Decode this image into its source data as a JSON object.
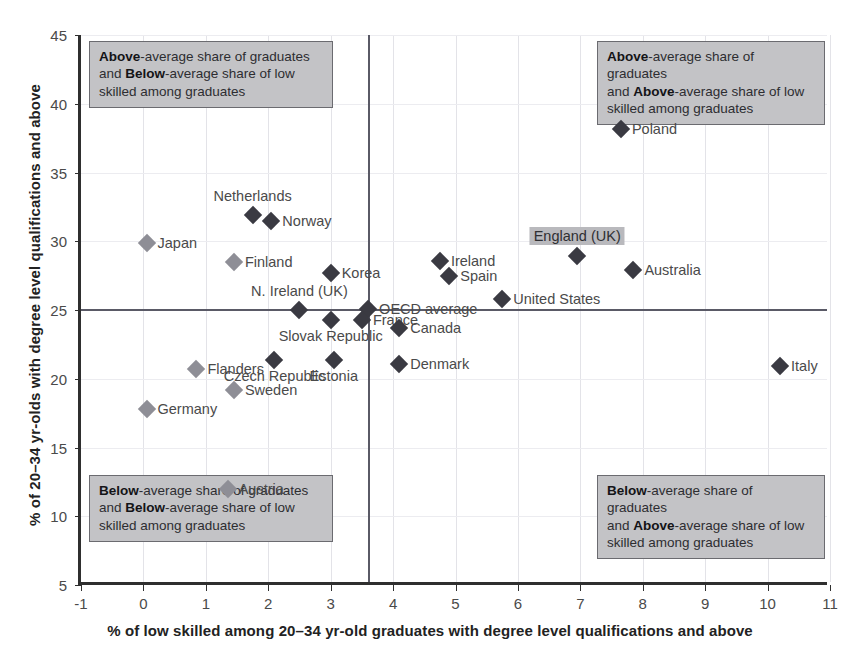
{
  "chart_data": {
    "type": "scatter",
    "title": "",
    "xlabel": "% of low skilled among 20–34 yr-old graduates with degree level qualifications and above",
    "ylabel": "% of 20–34 yr-olds with degree level qualifications and above",
    "xlim": [
      -1,
      11
    ],
    "ylim": [
      5,
      45
    ],
    "xticks": [
      "-1",
      "0",
      "1",
      "2",
      "3",
      "4",
      "5",
      "6",
      "7",
      "8",
      "9",
      "10",
      "11"
    ],
    "xtick_values": [
      -1,
      0,
      1,
      2,
      3,
      4,
      5,
      6,
      7,
      8,
      9,
      10,
      11
    ],
    "yticks": [
      "5",
      "10",
      "15",
      "20",
      "25",
      "30",
      "35",
      "40",
      "45"
    ],
    "ytick_values": [
      5,
      10,
      15,
      20,
      25,
      30,
      35,
      40,
      45
    ],
    "grid": true,
    "legend": "none",
    "reference_lines": {
      "vertical_x": 3.6,
      "horizontal_y": 25.1,
      "description": "OECD average lines"
    },
    "points": [
      {
        "label": "Japan",
        "x": 0.05,
        "y": 29.9,
        "marker": "light",
        "label_pos": "right"
      },
      {
        "label": "Netherlands",
        "x": 1.75,
        "y": 31.9,
        "marker": "dark",
        "label_pos": "above"
      },
      {
        "label": "Norway",
        "x": 2.05,
        "y": 31.5,
        "marker": "dark",
        "label_pos": "right"
      },
      {
        "label": "Finland",
        "x": 1.45,
        "y": 28.5,
        "marker": "light",
        "label_pos": "right"
      },
      {
        "label": "Korea",
        "x": 3.0,
        "y": 27.7,
        "marker": "dark",
        "label_pos": "right"
      },
      {
        "label": "Ireland",
        "x": 4.75,
        "y": 28.6,
        "marker": "dark",
        "label_pos": "right"
      },
      {
        "label": "Spain",
        "x": 4.9,
        "y": 27.5,
        "marker": "dark",
        "label_pos": "right"
      },
      {
        "label": "Poland",
        "x": 7.65,
        "y": 38.2,
        "marker": "dark",
        "label_pos": "right"
      },
      {
        "label": "England (UK)",
        "x": 6.95,
        "y": 28.9,
        "marker": "dark",
        "label_pos": "above",
        "highlight": true
      },
      {
        "label": "Australia",
        "x": 7.85,
        "y": 27.9,
        "marker": "dark",
        "label_pos": "right"
      },
      {
        "label": "United States",
        "x": 5.75,
        "y": 25.8,
        "marker": "dark",
        "label_pos": "right"
      },
      {
        "label": "N. Ireland (UK)",
        "x": 2.5,
        "y": 25.0,
        "marker": "dark",
        "label_pos": "above"
      },
      {
        "label": "OECD average",
        "x": 3.6,
        "y": 25.1,
        "marker": "dark",
        "label_pos": "right"
      },
      {
        "label": "France",
        "x": 3.5,
        "y": 24.3,
        "marker": "dark",
        "label_pos": "right"
      },
      {
        "label": "Slovak Republic",
        "x": 3.0,
        "y": 24.3,
        "marker": "dark",
        "label_pos": "below"
      },
      {
        "label": "Canada",
        "x": 4.1,
        "y": 23.7,
        "marker": "dark",
        "label_pos": "right"
      },
      {
        "label": "Czech Republic",
        "x": 2.1,
        "y": 21.4,
        "marker": "dark",
        "label_pos": "below"
      },
      {
        "label": "Estonia",
        "x": 3.05,
        "y": 21.4,
        "marker": "dark",
        "label_pos": "below"
      },
      {
        "label": "Denmark",
        "x": 4.1,
        "y": 21.1,
        "marker": "dark",
        "label_pos": "right"
      },
      {
        "label": "Italy",
        "x": 10.2,
        "y": 20.9,
        "marker": "dark",
        "label_pos": "right"
      },
      {
        "label": "Flanders",
        "x": 0.85,
        "y": 20.7,
        "marker": "light",
        "label_pos": "right"
      },
      {
        "label": "Sweden",
        "x": 1.45,
        "y": 19.2,
        "marker": "light",
        "label_pos": "right"
      },
      {
        "label": "Germany",
        "x": 0.05,
        "y": 17.8,
        "marker": "light",
        "label_pos": "right"
      },
      {
        "label": "Austria",
        "x": 1.35,
        "y": 12.0,
        "marker": "light",
        "label_pos": "right"
      }
    ],
    "annotations": [
      {
        "id": "top-left",
        "line1_bold": "Above",
        "line1_rest": "-average share of graduates",
        "line2_pre": "and ",
        "line2_bold": "Below",
        "line2_rest": "-average share of low",
        "line3": "skilled among graduates"
      },
      {
        "id": "top-right",
        "line1_bold": "Above",
        "line1_rest": "-average share of graduates",
        "line2_pre": "and ",
        "line2_bold": "Above",
        "line2_rest": "-average share of low",
        "line3": "skilled among graduates"
      },
      {
        "id": "bottom-left",
        "line1_bold": "Below",
        "line1_rest": "-average share of graduates",
        "line2_pre": "and ",
        "line2_bold": "Below",
        "line2_rest": "-average share of low",
        "line3": "skilled among graduates"
      },
      {
        "id": "bottom-right",
        "line1_bold": "Below",
        "line1_rest": "-average share of graduates",
        "line2_pre": "and ",
        "line2_bold": "Above",
        "line2_rest": "-average share of low",
        "line3": "skilled among graduates"
      }
    ],
    "colors": {
      "marker_dark": "#3a3a42",
      "marker_light": "#8e8e96",
      "reference_line": "#5a5a66",
      "annotation_box": "#c3c3c6",
      "axis": "#2f2f2f",
      "grid": "#e3e3e8"
    }
  }
}
